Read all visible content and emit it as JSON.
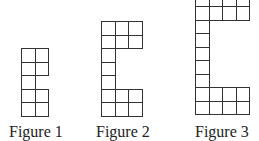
{
  "figures": [
    {
      "label": "Figure 1",
      "label_pos": {
        "x": 9,
        "y": 124
      },
      "origin": {
        "x": 21,
        "y": 48
      },
      "cell_size": 13.6,
      "rows": [
        2,
        2,
        1,
        2,
        2
      ]
    },
    {
      "label": "Figure 2",
      "label_pos": {
        "x": 96,
        "y": 124
      },
      "origin": {
        "x": 101,
        "y": 21
      },
      "cell_size": 13.5,
      "rows": [
        3,
        3,
        1,
        1,
        1,
        3,
        3
      ]
    },
    {
      "label": "Figure 3",
      "label_pos": {
        "x": 195,
        "y": 124
      },
      "origin": {
        "x": 195,
        "y": -7.5
      },
      "cell_size": 13.5,
      "rows": [
        4,
        4,
        1,
        1,
        1,
        1,
        1,
        4,
        4
      ]
    }
  ],
  "colors": {
    "line": "#333333",
    "text": "#222222",
    "background": "#ffffff"
  }
}
